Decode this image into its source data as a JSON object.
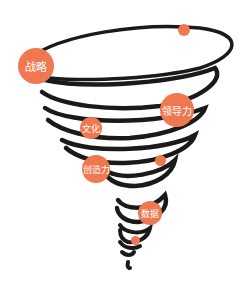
{
  "diagram": {
    "type": "tornado",
    "accent_color": "#f07850",
    "line_color": "#1a1a1a",
    "labels": [
      {
        "id": "strategy",
        "text": "战略"
      },
      {
        "id": "culture",
        "text": "文化"
      },
      {
        "id": "leadership",
        "text": "领导力"
      },
      {
        "id": "creativity",
        "text": "创造力"
      },
      {
        "id": "data",
        "text": "数据"
      }
    ]
  }
}
